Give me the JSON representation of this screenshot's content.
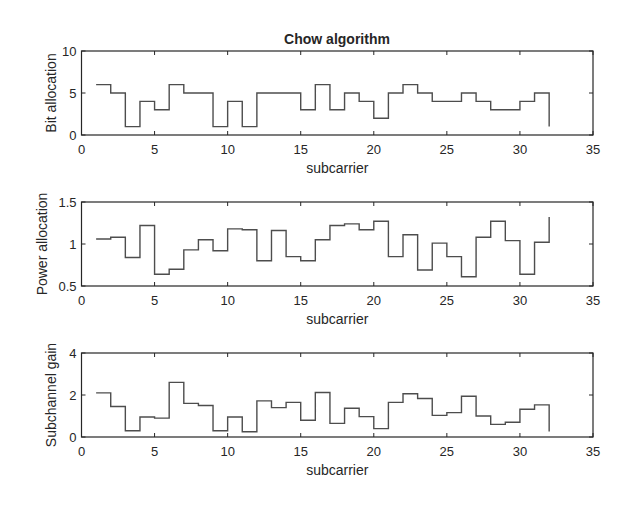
{
  "figure": {
    "title": "Chow algorithm"
  },
  "chart_data": [
    {
      "type": "line",
      "style": "stairs",
      "title": "Chow algorithm",
      "xlabel": "subcarrier",
      "ylabel": "Bit allocation",
      "xlim": [
        0,
        35
      ],
      "ylim": [
        0,
        10
      ],
      "xticks": [
        0,
        5,
        10,
        15,
        20,
        25,
        30,
        35
      ],
      "yticks": [
        0,
        5,
        10
      ],
      "grid": false,
      "x": [
        1,
        2,
        3,
        4,
        5,
        6,
        7,
        8,
        9,
        10,
        11,
        12,
        13,
        14,
        15,
        16,
        17,
        18,
        19,
        20,
        21,
        22,
        23,
        24,
        25,
        26,
        27,
        28,
        29,
        30,
        31,
        32
      ],
      "values": [
        6,
        5,
        1,
        4,
        3,
        6,
        5,
        5,
        1,
        4,
        1,
        5,
        5,
        5,
        3,
        6,
        3,
        5,
        4,
        2,
        5,
        6,
        5,
        4,
        4,
        5,
        4,
        3,
        3,
        4,
        5,
        1
      ]
    },
    {
      "type": "line",
      "style": "stairs",
      "title": "",
      "xlabel": "subcarrier",
      "ylabel": "Power allocation",
      "xlim": [
        0,
        35
      ],
      "ylim": [
        0.5,
        1.5
      ],
      "xticks": [
        0,
        5,
        10,
        15,
        20,
        25,
        30,
        35
      ],
      "yticks": [
        0.5,
        1,
        1.5
      ],
      "grid": false,
      "x": [
        1,
        2,
        3,
        4,
        5,
        6,
        7,
        8,
        9,
        10,
        11,
        12,
        13,
        14,
        15,
        16,
        17,
        18,
        19,
        20,
        21,
        22,
        23,
        24,
        25,
        26,
        27,
        28,
        29,
        30,
        31,
        32
      ],
      "values": [
        1.06,
        1.08,
        0.84,
        1.22,
        0.64,
        0.7,
        0.93,
        1.05,
        0.92,
        1.18,
        1.17,
        0.8,
        1.16,
        0.85,
        0.8,
        1.05,
        1.22,
        1.24,
        1.17,
        1.27,
        0.85,
        1.11,
        0.69,
        1.01,
        0.85,
        0.61,
        1.08,
        1.27,
        1.04,
        0.64,
        1.02,
        1.32
      ]
    },
    {
      "type": "line",
      "style": "stairs",
      "title": "",
      "xlabel": "subcarrier",
      "ylabel": "Subchannel gain",
      "xlim": [
        0,
        35
      ],
      "ylim": [
        0,
        4
      ],
      "xticks": [
        0,
        5,
        10,
        15,
        20,
        25,
        30,
        35
      ],
      "yticks": [
        0,
        2,
        4
      ],
      "grid": false,
      "x": [
        1,
        2,
        3,
        4,
        5,
        6,
        7,
        8,
        9,
        10,
        11,
        12,
        13,
        14,
        15,
        16,
        17,
        18,
        19,
        20,
        21,
        22,
        23,
        24,
        25,
        26,
        27,
        28,
        29,
        30,
        31,
        32
      ],
      "values": [
        2.1,
        1.45,
        0.3,
        0.95,
        0.9,
        2.6,
        1.6,
        1.5,
        0.3,
        0.95,
        0.25,
        1.72,
        1.4,
        1.65,
        0.8,
        2.12,
        0.65,
        1.37,
        0.97,
        0.4,
        1.65,
        2.06,
        1.83,
        1.03,
        1.16,
        1.94,
        1.0,
        0.6,
        0.7,
        1.32,
        1.53,
        0.26
      ]
    }
  ],
  "colors": {
    "line": "#4d4d4d",
    "axes": "#262626",
    "background": "#ffffff"
  }
}
